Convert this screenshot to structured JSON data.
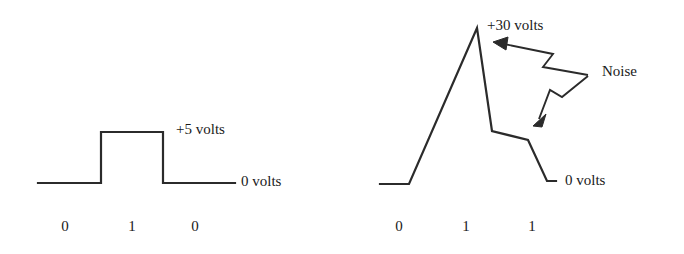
{
  "figure": {
    "background_color": "#ffffff",
    "stroke_color": "#2b2b2b",
    "text_color": "#1a1a1a",
    "stroke_width": 2.2
  },
  "panels": [
    {
      "id": "clean-signal",
      "name": "Clean digital signal",
      "labels": {
        "high_level": "+5 volts",
        "low_level": "0 volts"
      },
      "bits": [
        "0",
        "1",
        "0"
      ]
    },
    {
      "id": "noisy-signal",
      "name": "Signal degraded by noise",
      "labels": {
        "high_level": "+30 volts",
        "low_level": "0 volts",
        "noise": "Noise"
      },
      "bits": [
        "0",
        "1",
        "1"
      ]
    }
  ],
  "chart_data": {
    "type": "line",
    "xlabel": "",
    "ylabel": "Voltage",
    "grid": false,
    "legend": "none",
    "charts": [
      {
        "name": "clean-signal",
        "annotations": [
          "+5 volts",
          "0 volts"
        ],
        "bit_labels": [
          "0",
          "1",
          "0"
        ],
        "levels_volts": [
          0,
          5,
          0
        ],
        "points_px": [
          [
            38,
            183
          ],
          [
            101,
            183
          ],
          [
            101,
            132
          ],
          [
            163,
            132
          ],
          [
            163,
            183
          ],
          [
            235,
            183
          ]
        ]
      },
      {
        "name": "noisy-signal",
        "annotations": [
          "+30 volts",
          "0 volts",
          "Noise"
        ],
        "bit_labels": [
          "0",
          "1",
          "1"
        ],
        "levels_volts": [
          0,
          30,
          12
        ],
        "points_px": [
          [
            380,
            184
          ],
          [
            409,
            184
          ],
          [
            477,
            28
          ],
          [
            492,
            131
          ],
          [
            528,
            140
          ],
          [
            547,
            181
          ],
          [
            556,
            181
          ]
        ]
      }
    ]
  }
}
